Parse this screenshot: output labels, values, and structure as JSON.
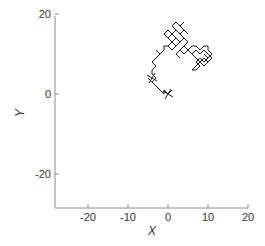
{
  "chart_data": {
    "type": "line",
    "title": "",
    "xlabel": "X",
    "ylabel": "Y",
    "xlim": [
      -28,
      20
    ],
    "ylim": [
      -28,
      20
    ],
    "xticks": [
      -20,
      -10,
      0,
      10,
      20
    ],
    "yticks": [
      -20,
      0,
      20
    ],
    "xtick_labels": [
      "-20",
      "-10",
      "0",
      "10",
      "20"
    ],
    "ytick_labels": [
      "-20",
      "0",
      "20"
    ],
    "grid": false,
    "legend": null,
    "series": [
      {
        "name": "random walk",
        "color": "#1a1a1a",
        "x": [
          0,
          1,
          0,
          -1,
          -1,
          -2,
          -3,
          -4,
          -5,
          -4,
          -3,
          -4,
          -4,
          -3,
          -4,
          -3,
          -2,
          -3,
          -2,
          -1,
          -1,
          0,
          1,
          0,
          1,
          0,
          -1,
          0,
          1,
          2,
          1,
          2,
          3,
          2,
          3,
          4,
          3,
          4,
          5,
          4,
          3,
          4,
          5,
          4,
          3,
          2,
          1,
          2,
          3,
          2,
          1,
          0,
          1,
          2,
          1,
          2,
          3,
          4,
          5,
          4,
          5,
          6,
          7,
          8,
          9,
          10,
          10,
          11,
          10,
          9,
          10,
          9,
          8,
          7,
          8,
          7,
          6,
          7,
          8,
          9,
          8,
          9,
          10,
          11,
          10,
          9,
          8,
          7,
          6,
          5,
          4,
          3,
          2,
          3,
          2,
          3,
          4,
          5,
          6,
          7,
          8,
          9,
          10,
          9
        ],
        "y": [
          0,
          1,
          0,
          1,
          0,
          1,
          2,
          3,
          4,
          3,
          4,
          5,
          6,
          7,
          8,
          9,
          10,
          11,
          10,
          11,
          12,
          12,
          13,
          14,
          15,
          16,
          15,
          14,
          15,
          16,
          17,
          18,
          17,
          18,
          17,
          18,
          17,
          16,
          15,
          16,
          15,
          14,
          13,
          14,
          15,
          16,
          15,
          14,
          13,
          12,
          13,
          12,
          11,
          12,
          13,
          14,
          13,
          14,
          13,
          12,
          11,
          12,
          12,
          11,
          12,
          12,
          11,
          10,
          9,
          10,
          9,
          8,
          9,
          8,
          7,
          6,
          6,
          7,
          8,
          9,
          8,
          7,
          8,
          9,
          10,
          11,
          10,
          11,
          10,
          11,
          12,
          11,
          10,
          9,
          10,
          11,
          10,
          11,
          10,
          9,
          8,
          9,
          8,
          7
        ]
      }
    ],
    "annotations": [
      {
        "type": "cross-marker",
        "x": 0,
        "y": 0
      },
      {
        "type": "cross-marker",
        "x": -4,
        "y": 4
      }
    ]
  },
  "axes": {
    "x_title": "X",
    "y_title": "Y"
  }
}
